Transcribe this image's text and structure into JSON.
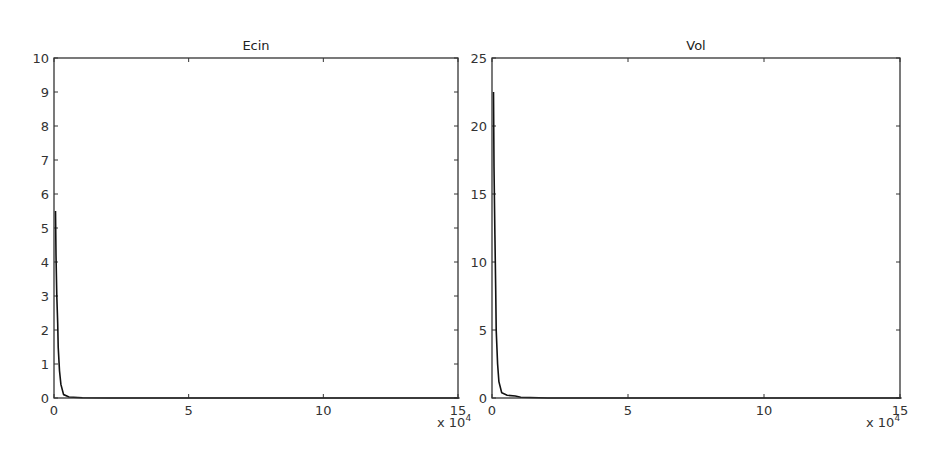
{
  "chart_data": [
    {
      "type": "line",
      "title": "Ecin",
      "xlabel": "",
      "ylabel": "",
      "x_multiplier_label": "x 10",
      "x_multiplier_exp": "4",
      "xlim": [
        0,
        15
      ],
      "ylim": [
        0,
        10
      ],
      "xticks": [
        "0",
        "5",
        "10",
        "15"
      ],
      "yticks": [
        "0",
        "1",
        "2",
        "3",
        "4",
        "5",
        "6",
        "7",
        "8",
        "9",
        "10"
      ],
      "grid": false,
      "series": [
        {
          "name": "Ecin",
          "x": [
            0,
            0.02,
            0.05,
            0.08,
            0.1,
            0.15,
            0.2,
            0.3,
            0.5,
            1.0,
            2.0,
            5.0,
            10.0,
            15.0
          ],
          "values": [
            5.5,
            4.2,
            3.0,
            2.2,
            1.5,
            0.8,
            0.4,
            0.1,
            0.03,
            0.01,
            0.0,
            0.0,
            0.0,
            0.0
          ]
        }
      ]
    },
    {
      "type": "line",
      "title": "Vol",
      "xlabel": "",
      "ylabel": "",
      "x_multiplier_label": "x 10",
      "x_multiplier_exp": "4",
      "xlim": [
        0,
        15
      ],
      "ylim": [
        0,
        25
      ],
      "xticks": [
        "0",
        "5",
        "10",
        "15"
      ],
      "yticks": [
        "0",
        "5",
        "10",
        "15",
        "20",
        "25"
      ],
      "grid": false,
      "series": [
        {
          "name": "Vol",
          "x": [
            0,
            0.02,
            0.05,
            0.08,
            0.1,
            0.15,
            0.2,
            0.3,
            0.5,
            0.8,
            1.0,
            2.0,
            5.0,
            10.0,
            15.0
          ],
          "values": [
            22.5,
            17.0,
            12.0,
            8.0,
            5.0,
            2.5,
            1.2,
            0.4,
            0.2,
            0.15,
            0.05,
            0.0,
            0.0,
            0.0,
            0.0
          ]
        }
      ]
    }
  ]
}
